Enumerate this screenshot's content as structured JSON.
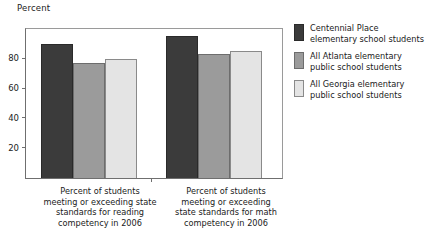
{
  "chart_data": {
    "type": "bar",
    "title": "",
    "ylabel": "Percent",
    "xlabel": "",
    "ylim": [
      0,
      100
    ],
    "yticks": [
      20,
      40,
      60,
      80
    ],
    "grid": false,
    "legend_position": "right",
    "categories": [
      "Percent of students meeting or exceeding state standards for reading competency in 2006",
      "Percent of students meeting or exceeding state standards for math competency in 2006"
    ],
    "category_lines": [
      [
        "Percent of students",
        "meeting or exceeding state",
        "standards for reading",
        "competency in 2006"
      ],
      [
        "Percent of students",
        "meeting or exceeding",
        "state standards for math",
        "competency in 2006"
      ]
    ],
    "series": [
      {
        "name": "Centennial Place elementary school students",
        "name_lines": [
          "Centennial Place",
          "elementary school students"
        ],
        "color": "#3b3b3b",
        "values": [
          90,
          95
        ]
      },
      {
        "name": "All Atlanta elementary public school students",
        "name_lines": [
          "All Atlanta elementary",
          "public school students"
        ],
        "color": "#9b9b9b",
        "values": [
          77,
          83
        ]
      },
      {
        "name": "All Georgia elementary public school students",
        "name_lines": [
          "All Georgia elementary",
          "public school students"
        ],
        "color": "#e4e4e4",
        "values": [
          80,
          85
        ]
      }
    ]
  }
}
